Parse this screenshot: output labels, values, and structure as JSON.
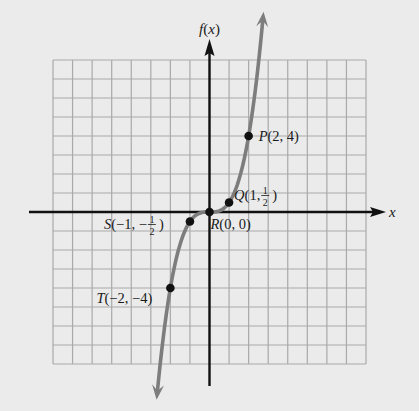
{
  "chart_data": {
    "type": "line",
    "title": "",
    "function_hint": "f(x) = x^3 / 2",
    "xlabel": "x",
    "ylabel": "f(x)",
    "xlim": [
      -8,
      8
    ],
    "ylim": [
      -8,
      8
    ],
    "grid": true,
    "grid_step": 1,
    "series": [
      {
        "name": "f(x)",
        "color": "#7d7d7d",
        "domain": [
          -2.66,
          2.72
        ],
        "arrows": "both"
      }
    ],
    "points": [
      {
        "name": "P",
        "x": 2,
        "y": 4,
        "label": "P(2, 4)",
        "label_prefix": "P",
        "label_text": "(2, 4)"
      },
      {
        "name": "Q",
        "x": 1,
        "y": 0.5,
        "label": "Q(1, 1/2)",
        "label_prefix": "Q",
        "label_text": "(1, ",
        "frac_num": "1",
        "frac_den": "2",
        "label_close": ")"
      },
      {
        "name": "R",
        "x": 0,
        "y": 0,
        "label": "R(0, 0)",
        "label_prefix": "R",
        "label_text": "(0, 0)"
      },
      {
        "name": "S",
        "x": -1,
        "y": -0.5,
        "label": "S(−1, −1/2)",
        "label_prefix": "S",
        "label_text": "(−1, −",
        "frac_num": "1",
        "frac_den": "2",
        "label_close": ")"
      },
      {
        "name": "T",
        "x": -2,
        "y": -4,
        "label": "T(−2, −4)",
        "label_prefix": "T",
        "label_text": "(−2, −4)"
      }
    ]
  },
  "colors": {
    "background": "#ebebeb",
    "grid": "#a9a9a9",
    "axis": "#111111",
    "curve": "#7d7d7d",
    "point": "#111111"
  }
}
